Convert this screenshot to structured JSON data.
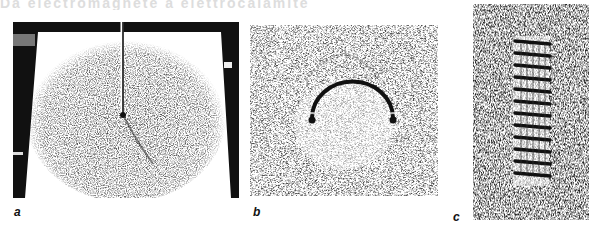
{
  "figure": {
    "top_text_cropped": "Da electromagnete a elettrocalamite",
    "panels": [
      {
        "id": "a",
        "label": "a",
        "description": "Iron filings around a straight vertical wire passing through a horizontal board"
      },
      {
        "id": "b",
        "label": "b",
        "description": "Iron filings around a semicircular loop conductor"
      },
      {
        "id": "c",
        "label": "c",
        "description": "Iron filings around a solenoid coil",
        "turns": 12
      }
    ],
    "colors": {
      "ink": "#111111",
      "paper": "#ffffff",
      "filings": "#444444"
    }
  }
}
